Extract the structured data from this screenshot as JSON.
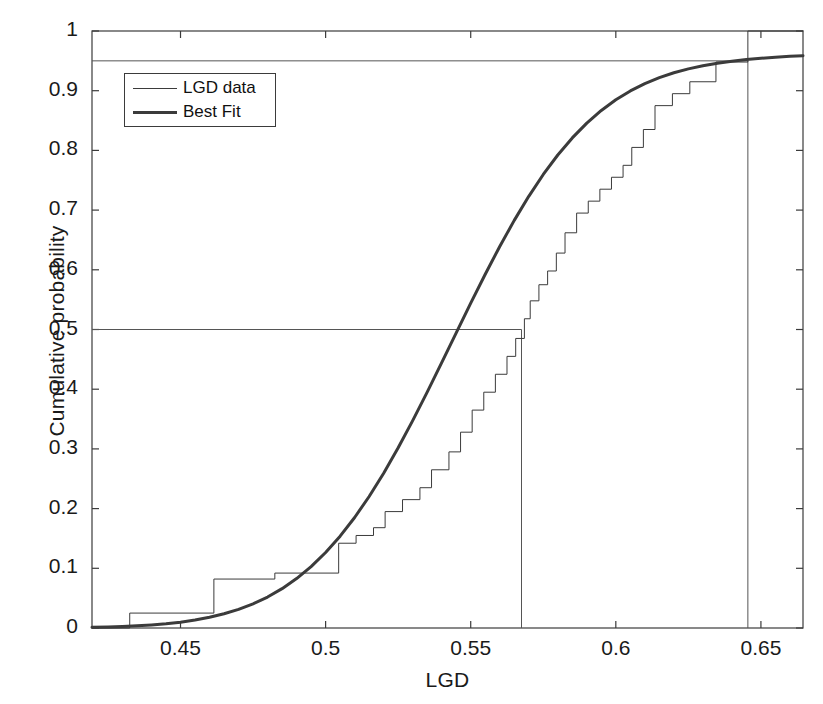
{
  "chart_data": {
    "type": "line",
    "title": "",
    "xlabel": "LGD",
    "ylabel": "Cumulative probability",
    "xlim": [
      0.4195,
      0.6645
    ],
    "ylim": [
      0,
      1
    ],
    "grid": false,
    "legend_position": "upper left",
    "xticks": [
      0.45,
      0.5,
      0.55,
      0.6,
      0.65
    ],
    "xtick_labels": [
      "0.45",
      "0.5",
      "0.55",
      "0.6",
      "0.65"
    ],
    "yticks": [
      0,
      0.1,
      0.2,
      0.3,
      0.4,
      0.5,
      0.6,
      0.7,
      0.8,
      0.9,
      1
    ],
    "ytick_labels": [
      "0",
      "0.1",
      "0.2",
      "0.3",
      "0.4",
      "0.5",
      "0.6",
      "0.7",
      "0.8",
      "0.9",
      "1"
    ],
    "series": [
      {
        "name": "LGD data",
        "style": "step",
        "linewidth": 1,
        "color": "#3b3b3b",
        "x": [
          0.4195,
          0.4325,
          0.4325,
          0.4615,
          0.4615,
          0.4825,
          0.4825,
          0.5045,
          0.5045,
          0.5105,
          0.5105,
          0.5165,
          0.5165,
          0.5205,
          0.5205,
          0.5265,
          0.5265,
          0.5325,
          0.5325,
          0.5365,
          0.5365,
          0.5425,
          0.5425,
          0.5465,
          0.5465,
          0.5505,
          0.5505,
          0.5545,
          0.5545,
          0.5585,
          0.5585,
          0.5625,
          0.5625,
          0.5655,
          0.5655,
          0.5685,
          0.5685,
          0.5705,
          0.5705,
          0.5735,
          0.5735,
          0.5765,
          0.5765,
          0.5795,
          0.5795,
          0.5825,
          0.5825,
          0.5865,
          0.5865,
          0.5905,
          0.5905,
          0.5945,
          0.5945,
          0.5985,
          0.5985,
          0.6025,
          0.6025,
          0.6055,
          0.6055,
          0.6095,
          0.6095,
          0.6135,
          0.6135,
          0.6195,
          0.6195,
          0.6255,
          0.6255,
          0.6345,
          0.6345,
          0.6455,
          0.6455,
          0.6645
        ],
        "y": [
          0,
          0,
          0.025,
          0.025,
          0.082,
          0.082,
          0.092,
          0.092,
          0.142,
          0.142,
          0.155,
          0.155,
          0.168,
          0.168,
          0.195,
          0.195,
          0.215,
          0.215,
          0.235,
          0.235,
          0.265,
          0.265,
          0.295,
          0.295,
          0.328,
          0.328,
          0.365,
          0.365,
          0.395,
          0.395,
          0.425,
          0.425,
          0.455,
          0.455,
          0.485,
          0.485,
          0.518,
          0.518,
          0.548,
          0.548,
          0.575,
          0.575,
          0.598,
          0.598,
          0.628,
          0.628,
          0.662,
          0.662,
          0.695,
          0.695,
          0.715,
          0.715,
          0.735,
          0.735,
          0.755,
          0.755,
          0.775,
          0.775,
          0.805,
          0.805,
          0.835,
          0.835,
          0.875,
          0.875,
          0.895,
          0.895,
          0.915,
          0.915,
          0.948,
          0.948,
          1.0,
          1.0
        ]
      },
      {
        "name": "Best Fit",
        "style": "smooth",
        "linewidth": 3,
        "color": "#3b3b3b",
        "distribution": "normal-cdf",
        "mu": 0.5675,
        "sigma": 0.0466,
        "x": [
          0.4195,
          0.425,
          0.43,
          0.435,
          0.44,
          0.445,
          0.45,
          0.455,
          0.46,
          0.465,
          0.47,
          0.475,
          0.48,
          0.485,
          0.49,
          0.495,
          0.5,
          0.505,
          0.51,
          0.515,
          0.52,
          0.525,
          0.53,
          0.535,
          0.54,
          0.545,
          0.55,
          0.555,
          0.56,
          0.565,
          0.57,
          0.575,
          0.58,
          0.585,
          0.59,
          0.595,
          0.6,
          0.605,
          0.61,
          0.615,
          0.62,
          0.625,
          0.63,
          0.635,
          0.64,
          0.645,
          0.65,
          0.655,
          0.66,
          0.6645
        ],
        "y": [
          0.0011,
          0.0017,
          0.0025,
          0.0036,
          0.0051,
          0.0071,
          0.0098,
          0.0133,
          0.0179,
          0.0238,
          0.0312,
          0.0405,
          0.0519,
          0.0659,
          0.0828,
          0.1029,
          0.1265,
          0.1538,
          0.1851,
          0.2203,
          0.2593,
          0.3018,
          0.3473,
          0.3951,
          0.4444,
          0.4944,
          0.5441,
          0.5926,
          0.6391,
          0.6828,
          0.7231,
          0.7597,
          0.7923,
          0.8209,
          0.8457,
          0.8669,
          0.8847,
          0.8996,
          0.9119,
          0.9219,
          0.93,
          0.9366,
          0.9419,
          0.9461,
          0.9495,
          0.9522,
          0.9544,
          0.9561,
          0.9575,
          0.9585
        ]
      }
    ],
    "reference_lines": [
      {
        "name": "median-horizontal",
        "orientation": "horizontal",
        "value": 0.5,
        "from": 0.4195,
        "to": 0.5675
      },
      {
        "name": "median-vertical",
        "orientation": "vertical",
        "value": 0.5675,
        "from": 0,
        "to": 0.5
      },
      {
        "name": "percentile95-horizontal",
        "orientation": "horizontal",
        "value": 0.95,
        "from": 0.4195,
        "to": 0.6455
      },
      {
        "name": "percentile95-vertical",
        "orientation": "vertical",
        "value": 0.6455,
        "from": 0,
        "to": 0.95
      }
    ]
  },
  "legend": {
    "entries": [
      {
        "label": "LGD data"
      },
      {
        "label": "Best Fit"
      }
    ]
  },
  "colors": {
    "axis": "#3b3b3b",
    "data_line": "#3b3b3b",
    "fit_line": "#3b3b3b",
    "reference_line": "#555555",
    "background": "#ffffff"
  }
}
